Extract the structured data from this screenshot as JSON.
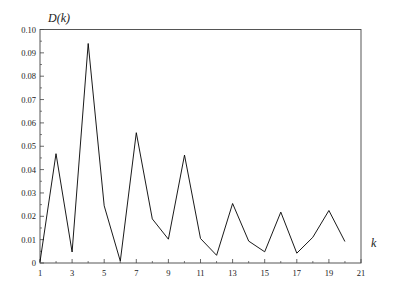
{
  "chart_data": {
    "type": "line",
    "title": "",
    "xlabel": "k",
    "ylabel": "D(k)",
    "xlim": [
      1,
      21
    ],
    "ylim": [
      0,
      0.1
    ],
    "grid": false,
    "legend": null,
    "x_ticks_major": [
      1,
      3,
      5,
      7,
      9,
      11,
      13,
      15,
      17,
      19,
      21
    ],
    "x_tick_labels": [
      "1",
      "3",
      "5",
      "7",
      "9",
      "11",
      "13",
      "15",
      "17",
      "19",
      "21"
    ],
    "y_ticks_major": [
      0,
      0.01,
      0.02,
      0.03,
      0.04,
      0.05,
      0.06,
      0.07,
      0.08,
      0.09,
      0.1
    ],
    "y_tick_labels": [
      "0",
      "0.01",
      "0.02",
      "0.03",
      "0.04",
      "0.05",
      "0.06",
      "0.07",
      "0.08",
      "0.09",
      "0.10"
    ],
    "x": [
      1,
      2,
      3,
      4,
      5,
      6,
      7,
      8,
      9,
      10,
      11,
      12,
      13,
      14,
      15,
      16,
      17,
      18,
      19,
      20
    ],
    "series": [
      {
        "name": "D(k)",
        "color": "#000000",
        "values": [
          0.0005,
          0.0468,
          0.0047,
          0.094,
          0.0245,
          0.0008,
          0.0558,
          0.0189,
          0.0102,
          0.0462,
          0.0105,
          0.0033,
          0.0255,
          0.0094,
          0.0048,
          0.0218,
          0.0042,
          0.011,
          0.0225,
          0.0092
        ]
      }
    ]
  }
}
